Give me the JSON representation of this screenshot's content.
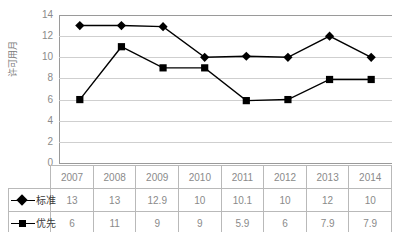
{
  "chart_data": {
    "type": "line",
    "title": "",
    "xlabel": "",
    "ylabel": "许可用月",
    "categories": [
      "2007",
      "2008",
      "2009",
      "2010",
      "2011",
      "2012",
      "2013",
      "2014"
    ],
    "series": [
      {
        "name": "标准",
        "marker": "diamond",
        "color": "#000000",
        "values": [
          13,
          13,
          12.9,
          10,
          10.1,
          10,
          12,
          10
        ]
      },
      {
        "name": "优先",
        "marker": "square",
        "color": "#000000",
        "values": [
          6,
          11,
          9,
          9,
          5.9,
          6,
          7.9,
          7.9
        ]
      }
    ],
    "yticks": [
      "14",
      "12",
      "10",
      "8",
      "6",
      "4",
      "2",
      "0"
    ],
    "ylim": [
      0,
      14
    ],
    "grid": true,
    "legend_position": "data-table-left",
    "gridline_color": "#cfcfcf",
    "axis_color": "#9a9a9a",
    "text_color": "#8a8a8a"
  },
  "table": {
    "header": [
      "",
      "2007",
      "2008",
      "2009",
      "2010",
      "2011",
      "2012",
      "2013",
      "2014"
    ],
    "rows": [
      {
        "label": "标准",
        "values": [
          "13",
          "13",
          "12.9",
          "10",
          "10.1",
          "10",
          "12",
          "10"
        ]
      },
      {
        "label": "优先",
        "values": [
          "6",
          "11",
          "9",
          "9",
          "5.9",
          "6",
          "7.9",
          "7.9"
        ]
      }
    ]
  }
}
